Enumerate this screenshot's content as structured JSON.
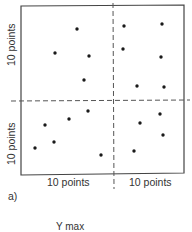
{
  "figure": {
    "panel_label": "a)",
    "x_labels": [
      "10 points",
      "10 points"
    ],
    "y_labels": [
      "10 points",
      "10 points"
    ],
    "next_figure_label": "Y max",
    "colors": {
      "ink": "#1a1a1a",
      "frame": "#444444",
      "dash": "#555555",
      "background": "#ffffff"
    }
  },
  "chart_data": {
    "type": "scatter",
    "title": "",
    "xlabel": [
      "10 points",
      "10 points"
    ],
    "ylabel": [
      "10 points",
      "10 points"
    ],
    "grid": false,
    "pixel_frame": {
      "left": 21,
      "right": 184,
      "top": 6,
      "bottom": 175,
      "divider_x": 113,
      "divider_y": 101
    },
    "series": [
      {
        "name": "top-left",
        "points": [
          [
            77,
            29
          ],
          [
            55,
            53
          ],
          [
            89,
            56
          ],
          [
            84,
            80
          ]
        ]
      },
      {
        "name": "top-right",
        "points": [
          [
            124,
            26
          ],
          [
            162,
            24
          ],
          [
            123,
            49
          ],
          [
            161,
            57
          ],
          [
            137,
            86
          ],
          [
            164,
            87
          ]
        ]
      },
      {
        "name": "bottom-left",
        "points": [
          [
            88,
            111
          ],
          [
            45,
            125
          ],
          [
            69,
            119
          ],
          [
            54,
            142
          ],
          [
            35,
            148
          ],
          [
            101,
            155
          ]
        ]
      },
      {
        "name": "bottom-right",
        "points": [
          [
            160,
            114
          ],
          [
            140,
            123
          ],
          [
            163,
            135
          ],
          [
            134,
            151
          ]
        ]
      }
    ]
  }
}
